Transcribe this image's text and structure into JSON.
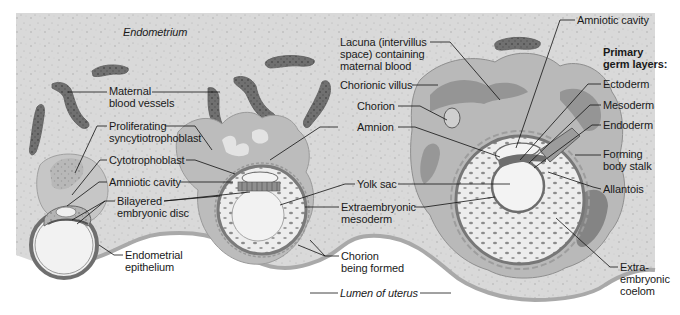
{
  "colors": {
    "background": "#ffffff",
    "endometrium": "#d9d9d9",
    "endometrium_speckle": "#9a9a9a",
    "vessel": "#6f6f6f",
    "vessel_dark": "#4a4a4a",
    "syncytio": "#b8b8b8",
    "cavity": "#f1f1f1",
    "membrane": "#7a7a7a",
    "label_text": "#1a1a1a",
    "leader_line": "#111111"
  },
  "region_labels": [
    {
      "id": "endometrium",
      "text": "Endometrium",
      "x": 123,
      "y": 32,
      "style": "italic"
    },
    {
      "id": "lumen-of-uterus",
      "text": "Lumen of uterus",
      "x": 340,
      "y": 285,
      "style": "italic"
    }
  ],
  "labels": [
    {
      "id": "maternal-blood-vessels",
      "text": "Maternal\nblood vessels",
      "x": 109,
      "y": 88
    },
    {
      "id": "proliferating-syncytiotrophoblast",
      "text": "Proliferating\nsyncytiotrophoblast",
      "x": 109,
      "y": 121
    },
    {
      "id": "cytotrophoblast",
      "text": "Cytotrophoblast",
      "x": 109,
      "y": 155
    },
    {
      "id": "amniotic-cavity-early",
      "text": "Amniotic cavity",
      "x": 109,
      "y": 176
    },
    {
      "id": "bilayered-embryonic-disc",
      "text": "Bilayered\nembryonic disc",
      "x": 117,
      "y": 196
    },
    {
      "id": "endometrial-epithelium",
      "text": "Endometrial\nepithelium",
      "x": 125,
      "y": 250
    },
    {
      "id": "lacuna",
      "text": "Lacuna (intervillus\nspace) containing\nmaternal blood",
      "x": 340,
      "y": 37
    },
    {
      "id": "chorionic-villus",
      "text": "Chorionic villus",
      "x": 340,
      "y": 80
    },
    {
      "id": "chorion",
      "text": "Chorion",
      "x": 357,
      "y": 101
    },
    {
      "id": "amnion",
      "text": "Amnion",
      "x": 357,
      "y": 122
    },
    {
      "id": "yolk-sac",
      "text": "Yolk sac",
      "x": 357,
      "y": 179
    },
    {
      "id": "extraembryonic-mesoderm",
      "text": "Extraembryonic\nmesoderm",
      "x": 341,
      "y": 201
    },
    {
      "id": "chorion-being-formed",
      "text": "Chorion\nbeing formed",
      "x": 341,
      "y": 251
    },
    {
      "id": "amniotic-cavity-late",
      "text": "Amniotic cavity",
      "x": 577,
      "y": 15
    },
    {
      "id": "primary-germ-layers",
      "text": "Primary\ngerm layers:",
      "x": 603,
      "y": 47,
      "style": "bold"
    },
    {
      "id": "ectoderm",
      "text": "Ectoderm",
      "x": 603,
      "y": 79
    },
    {
      "id": "mesoderm",
      "text": "Mesoderm",
      "x": 603,
      "y": 100
    },
    {
      "id": "endoderm",
      "text": "Endoderm",
      "x": 603,
      "y": 120
    },
    {
      "id": "forming-body-stalk",
      "text": "Forming\nbody stalk",
      "x": 603,
      "y": 149
    },
    {
      "id": "allantois",
      "text": "Allantois",
      "x": 603,
      "y": 184
    },
    {
      "id": "extra-embryonic-coelom",
      "text": "Extra-\nembryonic\ncoelom",
      "x": 620,
      "y": 262
    }
  ],
  "leader_lines": [
    {
      "for": "maternal-blood-vessels",
      "points": [
        [
          107,
          92
        ],
        [
          68,
          92
        ]
      ]
    },
    {
      "for": "maternal-blood-vessels",
      "points": [
        [
          152,
          92
        ],
        [
          220,
          92
        ]
      ]
    },
    {
      "for": "proliferating-syncytiotrophoblast",
      "points": [
        [
          107,
          126
        ],
        [
          97,
          126
        ],
        [
          75,
          173
        ]
      ]
    },
    {
      "for": "proliferating-syncytiotrophoblast",
      "points": [
        [
          165,
          126
        ],
        [
          195,
          126
        ],
        [
          212,
          150
        ]
      ]
    },
    {
      "for": "cytotrophoblast",
      "points": [
        [
          107,
          160
        ],
        [
          100,
          160
        ],
        [
          72,
          195
        ]
      ]
    },
    {
      "for": "cytotrophoblast",
      "points": [
        [
          186,
          160
        ],
        [
          195,
          160
        ],
        [
          235,
          174
        ]
      ]
    },
    {
      "for": "amniotic-cavity-early",
      "points": [
        [
          107,
          182
        ],
        [
          99,
          182
        ],
        [
          67,
          206
        ]
      ]
    },
    {
      "for": "amniotic-cavity-early",
      "points": [
        [
          180,
          182
        ],
        [
          233,
          182
        ]
      ]
    },
    {
      "for": "bilayered-embryonic-disc",
      "points": [
        [
          115,
          201
        ],
        [
          105,
          201
        ],
        [
          72,
          220
        ]
      ]
    },
    {
      "for": "bilayered-embryonic-disc",
      "points": [
        [
          105,
          201
        ],
        [
          77,
          224
        ]
      ]
    },
    {
      "for": "bilayered-embryonic-disc",
      "points": [
        [
          164,
          201
        ],
        [
          220,
          196
        ]
      ]
    },
    {
      "for": "bilayered-embryonic-disc",
      "points": [
        [
          164,
          201
        ],
        [
          250,
          192
        ]
      ]
    },
    {
      "for": "endometrial-epithelium",
      "points": [
        [
          123,
          255
        ],
        [
          114,
          255
        ],
        [
          99,
          245
        ]
      ]
    },
    {
      "for": "chorionic-villus",
      "points": [
        [
          412,
          85
        ],
        [
          438,
          85
        ]
      ]
    },
    {
      "for": "chorion",
      "points": [
        [
          398,
          106
        ],
        [
          420,
          106
        ],
        [
          447,
          120
        ]
      ]
    },
    {
      "for": "amnion",
      "points": [
        [
          338,
          127
        ],
        [
          320,
          127
        ],
        [
          270,
          160
        ]
      ]
    },
    {
      "for": "amnion",
      "points": [
        [
          398,
          127
        ],
        [
          415,
          127
        ],
        [
          500,
          157
        ]
      ]
    },
    {
      "for": "yolk-sac",
      "points": [
        [
          355,
          184
        ],
        [
          345,
          184
        ],
        [
          280,
          205
        ]
      ]
    },
    {
      "for": "yolk-sac",
      "points": [
        [
          398,
          184
        ],
        [
          510,
          184
        ]
      ]
    },
    {
      "for": "extraembryonic-mesoderm",
      "points": [
        [
          339,
          207
        ],
        [
          305,
          207
        ]
      ]
    },
    {
      "for": "extraembryonic-mesoderm",
      "points": [
        [
          414,
          207
        ],
        [
          425,
          207
        ],
        [
          495,
          197
        ]
      ]
    },
    {
      "for": "chorion-being-formed",
      "points": [
        [
          339,
          256
        ],
        [
          325,
          256
        ],
        [
          310,
          240
        ]
      ]
    },
    {
      "for": "chorion-being-formed",
      "points": [
        [
          325,
          256
        ],
        [
          298,
          245
        ]
      ]
    },
    {
      "for": "lacuna",
      "points": [
        [
          430,
          42
        ],
        [
          450,
          42
        ],
        [
          500,
          100
        ]
      ]
    },
    {
      "for": "amniotic-cavity-late",
      "points": [
        [
          575,
          20
        ],
        [
          560,
          20
        ],
        [
          516,
          148
        ]
      ]
    },
    {
      "for": "ectoderm",
      "points": [
        [
          601,
          84
        ],
        [
          588,
          84
        ],
        [
          520,
          160
        ]
      ]
    },
    {
      "for": "mesoderm",
      "points": [
        [
          601,
          105
        ],
        [
          590,
          105
        ],
        [
          529,
          163
        ]
      ]
    },
    {
      "for": "endoderm",
      "points": [
        [
          601,
          125
        ],
        [
          592,
          125
        ],
        [
          534,
          168
        ]
      ]
    },
    {
      "for": "forming-body-stalk",
      "points": [
        [
          601,
          155
        ],
        [
          575,
          155
        ]
      ]
    },
    {
      "for": "allantois",
      "points": [
        [
          601,
          189
        ],
        [
          593,
          187
        ],
        [
          548,
          172
        ]
      ]
    },
    {
      "for": "extra-embryonic-coelom",
      "points": [
        [
          618,
          267
        ],
        [
          610,
          267
        ],
        [
          556,
          218
        ]
      ]
    },
    {
      "for": "lumen-of-uterus",
      "points": [
        [
          310,
          293
        ],
        [
          338,
          293
        ]
      ]
    },
    {
      "for": "lumen-of-uterus",
      "points": [
        [
          420,
          293
        ],
        [
          451,
          293
        ]
      ]
    }
  ],
  "stages": [
    {
      "id": "early-implantation",
      "description": "Blastocyst embedding in endometrium"
    },
    {
      "id": "mid-implantation",
      "description": "Implanted embryo with chorion being formed"
    },
    {
      "id": "late-implantation",
      "description": "Embryo with primary germ layers and chorionic villi"
    }
  ]
}
